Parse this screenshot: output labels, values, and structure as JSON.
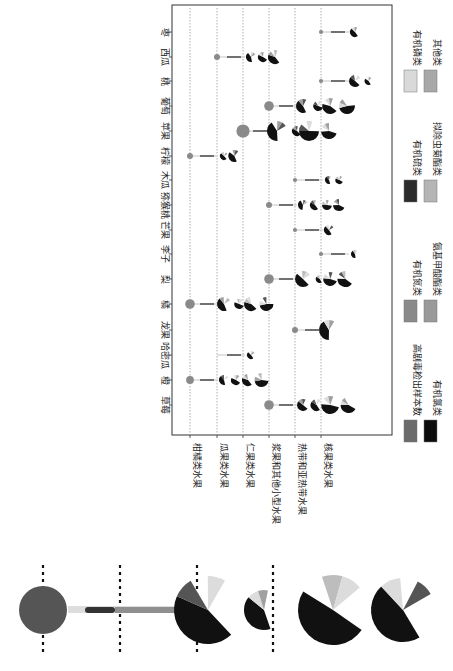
{
  "chart_data": {
    "type": "pie",
    "title": "",
    "orientation_note": "figure rotated 90 degrees clockwise on page",
    "xlabel": "",
    "ylabel": "",
    "fruits": [
      "草莓",
      "橙",
      "哈密瓜",
      "龙果",
      "橘",
      "梨",
      "李子",
      "芒果",
      "猕猴桃",
      "木瓜",
      "柠檬",
      "苹果",
      "葡萄",
      "桃",
      "西瓜",
      "枣"
    ],
    "categories": [
      "柑橘类水果",
      "瓜果类水果",
      "仁果类水果",
      "浆果和其他小型水果",
      "热带和亚热带水果",
      "核果类水果"
    ],
    "grid": true,
    "legend": [
      {
        "label": "高剧毒检出样本数",
        "color": "#6b6b6b"
      },
      {
        "label": "有机氮类",
        "color": "#8a8a8a"
      },
      {
        "label": "有机硫类",
        "color": "#2b2b2b"
      },
      {
        "label": "有机磷类",
        "color": "#d9d9d9"
      },
      {
        "label": "有机氯类",
        "color": "#0d0d0d"
      },
      {
        "label": "氨基甲酸酯类",
        "color": "#9a9a9a"
      },
      {
        "label": "拟除虫菊酯类",
        "color": "#b5b5b5"
      },
      {
        "label": "其他类",
        "color": "#a8a8a8"
      }
    ],
    "points": [
      {
        "fruit": "草莓",
        "category": "浆果和其他小型水果",
        "dot_size": 4,
        "pies": [
          6,
          6,
          9,
          8
        ]
      },
      {
        "fruit": "橙",
        "category": "柑橘类水果",
        "dot_size": 3,
        "pies": [
          5,
          5,
          6,
          7
        ]
      },
      {
        "fruit": "哈密瓜",
        "category": "瓜果类水果",
        "dot_size": 0,
        "pies": [
          4
        ]
      },
      {
        "fruit": "龙果",
        "category": "热带和亚热带水果",
        "dot_size": 2,
        "pies": [
          10
        ]
      },
      {
        "fruit": "橘",
        "category": "柑橘类水果",
        "dot_size": 4,
        "pies": [
          7,
          5,
          7,
          7
        ]
      },
      {
        "fruit": "梨",
        "category": "浆果和其他小型水果",
        "dot_size": 4,
        "pies": [
          8,
          4,
          7,
          8
        ]
      },
      {
        "fruit": "李子",
        "category": "核果类水果",
        "dot_size": 1,
        "pies": [
          4
        ]
      },
      {
        "fruit": "芒果",
        "category": "热带和亚热带水果",
        "dot_size": 1,
        "pies": [
          5
        ]
      },
      {
        "fruit": "猕猴桃",
        "category": "浆果和其他小型水果",
        "dot_size": 2,
        "pies": [
          5,
          5,
          5,
          6
        ]
      },
      {
        "fruit": "木瓜",
        "category": "热带和亚热带水果",
        "dot_size": 1,
        "pies": [
          4,
          4
        ]
      },
      {
        "fruit": "柠檬",
        "category": "柑橘类水果",
        "dot_size": 2,
        "pies": [
          4,
          6
        ]
      },
      {
        "fruit": "苹果",
        "category": "仁果类水果",
        "dot_size": 6,
        "pies": [
          10,
          5,
          10,
          8
        ]
      },
      {
        "fruit": "葡萄",
        "category": "浆果和其他小型水果",
        "dot_size": 4,
        "pies": [
          7,
          5,
          8,
          8
        ]
      },
      {
        "fruit": "桃",
        "category": "核果类水果",
        "dot_size": 1,
        "pies": [
          6,
          4
        ]
      },
      {
        "fruit": "西瓜",
        "category": "瓜果类水果",
        "dot_size": 2,
        "pies": [
          5,
          5,
          7
        ]
      },
      {
        "fruit": "枣",
        "category": "核果类水果",
        "dot_size": 1,
        "pies": [
          5
        ]
      }
    ],
    "inset": {
      "description": "enlarged view of a single row (rotated)",
      "dot_size": 24,
      "pies": [
        34,
        20,
        35,
        32
      ]
    }
  },
  "colors": {
    "dot": "#8a8a8a",
    "grid": "#9a9a9a",
    "axis": "#333333",
    "black": "#111111",
    "light": "#dcdcdc",
    "mid": "#a0a0a0",
    "dark": "#555555"
  }
}
